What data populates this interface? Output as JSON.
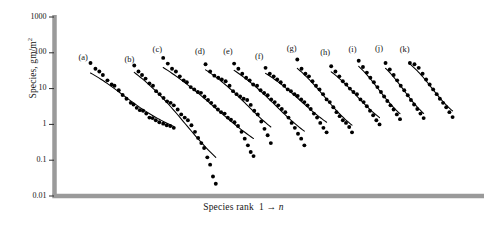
{
  "chart_data": {
    "type": "scatter",
    "title": "",
    "xlabel": "Species rank  1 → n",
    "ylabel": "Species, gm/m²",
    "ylabel_text": "Species, gm/m",
    "ylabel_exponent": "2",
    "xlabel_prefix": "Species rank",
    "xlabel_suffix": "1 → ",
    "xlabel_italic": "n",
    "yscale": "log",
    "ylim": [
      0.01,
      1000
    ],
    "ytick_labels": [
      "1000",
      "100",
      "10",
      "1",
      "0.1",
      "0.01"
    ],
    "ytick_values": [
      1000,
      100,
      10,
      1,
      0.1,
      0.01
    ],
    "xlim": [
      0,
      100
    ],
    "grid": false,
    "legend_position": "inline-panel-labels",
    "marker": "filled-circle",
    "marker_color": "#000000",
    "line_color": "#000000",
    "axis_color": "#9a9a9a",
    "background": "#ffffff",
    "series": [
      {
        "name": "(a)",
        "label_x": 8.5,
        "label_y": 70,
        "points": [
          {
            "x": 10.2,
            "y": 52
          },
          {
            "x": 11.6,
            "y": 36
          },
          {
            "x": 12.7,
            "y": 30
          },
          {
            "x": 13.7,
            "y": 24
          },
          {
            "x": 15.0,
            "y": 17
          },
          {
            "x": 16.2,
            "y": 13
          },
          {
            "x": 17.0,
            "y": 12
          },
          {
            "x": 18.2,
            "y": 9.0
          },
          {
            "x": 19.3,
            "y": 6.6
          },
          {
            "x": 20.4,
            "y": 5.2
          },
          {
            "x": 21.6,
            "y": 4.0
          },
          {
            "x": 22.4,
            "y": 3.6
          },
          {
            "x": 23.3,
            "y": 2.9
          },
          {
            "x": 24.2,
            "y": 2.5
          },
          {
            "x": 25.1,
            "y": 2.4
          },
          {
            "x": 26.0,
            "y": 2.0
          },
          {
            "x": 26.9,
            "y": 1.55
          },
          {
            "x": 27.8,
            "y": 1.5
          },
          {
            "x": 28.7,
            "y": 1.3
          },
          {
            "x": 29.7,
            "y": 1.15
          },
          {
            "x": 30.8,
            "y": 1.05
          },
          {
            "x": 31.8,
            "y": 0.95
          },
          {
            "x": 32.8,
            "y": 0.9
          },
          {
            "x": 33.8,
            "y": 0.8
          }
        ]
      },
      {
        "name": "(b)",
        "label_x": 21.5,
        "label_y": 62,
        "points": [
          {
            "x": 22.6,
            "y": 44
          },
          {
            "x": 23.8,
            "y": 30
          },
          {
            "x": 24.8,
            "y": 24
          },
          {
            "x": 25.8,
            "y": 19
          },
          {
            "x": 26.9,
            "y": 14
          },
          {
            "x": 27.9,
            "y": 12
          },
          {
            "x": 28.8,
            "y": 8.5
          },
          {
            "x": 29.8,
            "y": 7.0
          },
          {
            "x": 30.9,
            "y": 5.5
          },
          {
            "x": 31.9,
            "y": 4.4
          },
          {
            "x": 32.9,
            "y": 4.0
          },
          {
            "x": 33.8,
            "y": 3.4
          },
          {
            "x": 34.9,
            "y": 2.6
          },
          {
            "x": 35.9,
            "y": 1.9
          },
          {
            "x": 36.9,
            "y": 1.55
          },
          {
            "x": 37.8,
            "y": 1.3
          },
          {
            "x": 38.8,
            "y": 0.95
          },
          {
            "x": 39.8,
            "y": 0.62
          },
          {
            "x": 40.7,
            "y": 0.42
          },
          {
            "x": 41.6,
            "y": 0.3
          },
          {
            "x": 42.4,
            "y": 0.22
          },
          {
            "x": 43.3,
            "y": 0.12
          },
          {
            "x": 44.1,
            "y": 0.075
          },
          {
            "x": 44.9,
            "y": 0.035
          },
          {
            "x": 45.7,
            "y": 0.022
          }
        ]
      },
      {
        "name": "(c)",
        "label_x": 29.5,
        "label_y": 120,
        "points": [
          {
            "x": 30.8,
            "y": 72
          },
          {
            "x": 32.1,
            "y": 50
          },
          {
            "x": 33.3,
            "y": 36
          },
          {
            "x": 34.4,
            "y": 30
          },
          {
            "x": 35.5,
            "y": 22
          },
          {
            "x": 36.6,
            "y": 17
          },
          {
            "x": 37.5,
            "y": 15
          },
          {
            "x": 38.6,
            "y": 11
          },
          {
            "x": 39.6,
            "y": 9.5
          },
          {
            "x": 40.6,
            "y": 8.0
          },
          {
            "x": 41.5,
            "y": 7.6
          },
          {
            "x": 42.5,
            "y": 6.0
          },
          {
            "x": 43.5,
            "y": 4.8
          },
          {
            "x": 44.4,
            "y": 4.0
          },
          {
            "x": 45.4,
            "y": 3.2
          },
          {
            "x": 46.3,
            "y": 2.6
          },
          {
            "x": 47.2,
            "y": 2.2
          },
          {
            "x": 48.2,
            "y": 2.0
          },
          {
            "x": 49.1,
            "y": 1.55
          },
          {
            "x": 50.0,
            "y": 1.35
          },
          {
            "x": 51.0,
            "y": 1.15
          },
          {
            "x": 52.0,
            "y": 0.9
          },
          {
            "x": 53.0,
            "y": 0.62
          },
          {
            "x": 53.9,
            "y": 0.4
          },
          {
            "x": 54.8,
            "y": 0.26
          },
          {
            "x": 55.6,
            "y": 0.17
          },
          {
            "x": 56.4,
            "y": 0.13
          }
        ]
      },
      {
        "name": "(d)",
        "label_x": 41.5,
        "label_y": 105,
        "points": [
          {
            "x": 42.8,
            "y": 48
          },
          {
            "x": 44.1,
            "y": 30
          },
          {
            "x": 45.3,
            "y": 23
          },
          {
            "x": 46.4,
            "y": 20
          },
          {
            "x": 47.4,
            "y": 18
          },
          {
            "x": 48.5,
            "y": 16
          },
          {
            "x": 49.6,
            "y": 12
          },
          {
            "x": 50.6,
            "y": 8.5
          },
          {
            "x": 51.6,
            "y": 7.0
          },
          {
            "x": 52.6,
            "y": 6.0
          },
          {
            "x": 53.6,
            "y": 5.2
          },
          {
            "x": 54.6,
            "y": 4.8
          },
          {
            "x": 55.6,
            "y": 3.5
          },
          {
            "x": 56.6,
            "y": 2.4
          },
          {
            "x": 57.6,
            "y": 1.9
          },
          {
            "x": 58.6,
            "y": 1.2
          },
          {
            "x": 59.5,
            "y": 0.75
          },
          {
            "x": 60.4,
            "y": 0.5
          },
          {
            "x": 61.3,
            "y": 0.3
          }
        ]
      },
      {
        "name": "(e)",
        "label_x": 49.5,
        "label_y": 105,
        "points": [
          {
            "x": 50.9,
            "y": 50
          },
          {
            "x": 52.1,
            "y": 36
          },
          {
            "x": 53.2,
            "y": 26
          },
          {
            "x": 54.3,
            "y": 20
          },
          {
            "x": 55.3,
            "y": 17
          },
          {
            "x": 56.3,
            "y": 13
          },
          {
            "x": 57.4,
            "y": 12
          },
          {
            "x": 58.4,
            "y": 9.0
          },
          {
            "x": 59.4,
            "y": 7.5
          },
          {
            "x": 60.4,
            "y": 6.5
          },
          {
            "x": 61.4,
            "y": 5.0
          },
          {
            "x": 62.4,
            "y": 4.2
          },
          {
            "x": 63.4,
            "y": 3.4
          },
          {
            "x": 64.4,
            "y": 2.7
          },
          {
            "x": 65.4,
            "y": 2.2
          },
          {
            "x": 66.3,
            "y": 1.55
          },
          {
            "x": 67.2,
            "y": 1.1
          },
          {
            "x": 68.1,
            "y": 0.8
          },
          {
            "x": 69.0,
            "y": 0.55
          },
          {
            "x": 69.9,
            "y": 0.4
          },
          {
            "x": 70.8,
            "y": 0.26
          }
        ]
      },
      {
        "name": "(f)",
        "label_x": 58.5,
        "label_y": 78,
        "points": [
          {
            "x": 59.8,
            "y": 38
          },
          {
            "x": 61.0,
            "y": 26
          },
          {
            "x": 62.1,
            "y": 22
          },
          {
            "x": 63.1,
            "y": 18
          },
          {
            "x": 64.1,
            "y": 15
          },
          {
            "x": 65.1,
            "y": 12
          },
          {
            "x": 66.1,
            "y": 9.5
          },
          {
            "x": 67.0,
            "y": 8.5
          },
          {
            "x": 68.0,
            "y": 7.0
          },
          {
            "x": 68.9,
            "y": 6.2
          },
          {
            "x": 69.9,
            "y": 5.0
          },
          {
            "x": 70.8,
            "y": 4.2
          },
          {
            "x": 71.7,
            "y": 3.4
          },
          {
            "x": 72.6,
            "y": 2.7
          },
          {
            "x": 73.5,
            "y": 2.0
          },
          {
            "x": 74.4,
            "y": 1.55
          },
          {
            "x": 75.3,
            "y": 1.1
          },
          {
            "x": 76.2,
            "y": 0.8
          },
          {
            "x": 77.1,
            "y": 0.6
          }
        ]
      },
      {
        "name": "(g)",
        "label_x": 67.5,
        "label_y": 125,
        "points": [
          {
            "x": 68.8,
            "y": 65
          },
          {
            "x": 70.0,
            "y": 36
          },
          {
            "x": 71.1,
            "y": 26
          },
          {
            "x": 72.1,
            "y": 22
          },
          {
            "x": 73.1,
            "y": 16
          },
          {
            "x": 74.1,
            "y": 12
          },
          {
            "x": 75.1,
            "y": 9.5
          },
          {
            "x": 76.1,
            "y": 7.0
          },
          {
            "x": 77.1,
            "y": 5.0
          },
          {
            "x": 78.0,
            "y": 4.2
          },
          {
            "x": 79.0,
            "y": 3.0
          },
          {
            "x": 79.9,
            "y": 2.2
          },
          {
            "x": 80.8,
            "y": 1.7
          },
          {
            "x": 81.7,
            "y": 1.3
          },
          {
            "x": 82.6,
            "y": 1.1
          },
          {
            "x": 83.5,
            "y": 0.85
          },
          {
            "x": 84.3,
            "y": 0.6
          }
        ]
      },
      {
        "name": "(h)",
        "label_x": 77.0,
        "label_y": 100,
        "points": [
          {
            "x": 78.4,
            "y": 42
          },
          {
            "x": 79.6,
            "y": 30
          },
          {
            "x": 80.7,
            "y": 22
          },
          {
            "x": 81.7,
            "y": 16
          },
          {
            "x": 82.7,
            "y": 13
          },
          {
            "x": 83.7,
            "y": 10
          },
          {
            "x": 84.7,
            "y": 8.0
          },
          {
            "x": 85.7,
            "y": 7.0
          },
          {
            "x": 86.7,
            "y": 5.0
          },
          {
            "x": 87.6,
            "y": 4.2
          },
          {
            "x": 88.5,
            "y": 3.2
          },
          {
            "x": 89.4,
            "y": 2.4
          },
          {
            "x": 90.3,
            "y": 1.8
          },
          {
            "x": 91.2,
            "y": 1.3
          },
          {
            "x": 92.1,
            "y": 1.0
          }
        ]
      },
      {
        "name": "(i)",
        "label_x": 85.0,
        "label_y": 120,
        "points": [
          {
            "x": 86.2,
            "y": 60
          },
          {
            "x": 87.4,
            "y": 40
          },
          {
            "x": 88.5,
            "y": 28
          },
          {
            "x": 89.5,
            "y": 20
          },
          {
            "x": 90.5,
            "y": 15
          },
          {
            "x": 91.5,
            "y": 11
          },
          {
            "x": 92.5,
            "y": 8.0
          },
          {
            "x": 93.4,
            "y": 6.0
          },
          {
            "x": 94.3,
            "y": 4.5
          },
          {
            "x": 95.2,
            "y": 3.4
          },
          {
            "x": 96.1,
            "y": 2.6
          },
          {
            "x": 97.0,
            "y": 1.9
          },
          {
            "x": 97.9,
            "y": 1.4
          }
        ]
      },
      {
        "name": "(j)",
        "label_x": 92.5,
        "label_y": 125,
        "points": [
          {
            "x": 93.8,
            "y": 52
          },
          {
            "x": 95.0,
            "y": 34
          },
          {
            "x": 96.1,
            "y": 24
          },
          {
            "x": 97.1,
            "y": 17
          },
          {
            "x": 98.1,
            "y": 12
          },
          {
            "x": 99.1,
            "y": 9.0
          },
          {
            "x": 100.1,
            "y": 6.5
          },
          {
            "x": 101.0,
            "y": 4.8
          },
          {
            "x": 101.9,
            "y": 3.6
          },
          {
            "x": 102.8,
            "y": 2.7
          },
          {
            "x": 103.7,
            "y": 2.0
          },
          {
            "x": 104.6,
            "y": 1.5
          }
        ]
      },
      {
        "name": "(k)",
        "label_x": 99.5,
        "label_y": 120,
        "points": [
          {
            "x": 100.7,
            "y": 52
          },
          {
            "x": 102.0,
            "y": 48
          },
          {
            "x": 103.2,
            "y": 38
          },
          {
            "x": 104.3,
            "y": 26
          },
          {
            "x": 105.3,
            "y": 18
          },
          {
            "x": 106.3,
            "y": 13
          },
          {
            "x": 107.3,
            "y": 9.5
          },
          {
            "x": 108.3,
            "y": 7.0
          },
          {
            "x": 109.2,
            "y": 5.2
          },
          {
            "x": 110.1,
            "y": 4.0
          },
          {
            "x": 111.0,
            "y": 3.0
          },
          {
            "x": 111.9,
            "y": 2.2
          },
          {
            "x": 112.8,
            "y": 1.6
          }
        ]
      }
    ]
  }
}
